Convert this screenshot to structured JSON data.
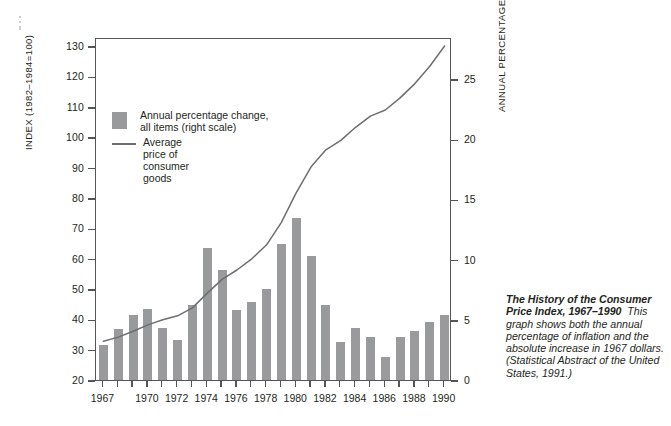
{
  "chart_data": {
    "type": "bar",
    "categories": [
      1967,
      1968,
      1969,
      1970,
      1971,
      1972,
      1973,
      1974,
      1975,
      1976,
      1977,
      1978,
      1979,
      1980,
      1981,
      1982,
      1983,
      1984,
      1985,
      1986,
      1987,
      1988,
      1989,
      1990
    ],
    "series": [
      {
        "name": "Annual percentage change, all items (right scale)",
        "type": "bar",
        "axis": "right",
        "unit": "percent",
        "values": [
          2.9,
          4.2,
          5.4,
          5.9,
          4.3,
          3.3,
          6.2,
          11.0,
          9.1,
          5.8,
          6.5,
          7.6,
          11.3,
          13.5,
          10.3,
          6.2,
          3.2,
          4.3,
          3.6,
          1.9,
          3.6,
          4.1,
          4.8,
          5.4
        ]
      },
      {
        "name": "Average price of consumer goods",
        "type": "line",
        "axis": "left",
        "unit": "index",
        "values": [
          33.4,
          34.8,
          36.7,
          38.8,
          40.5,
          41.8,
          44.4,
          49.3,
          53.8,
          56.9,
          60.6,
          65.2,
          72.6,
          82.4,
          90.9,
          96.5,
          99.6,
          103.9,
          107.6,
          109.6,
          113.6,
          118.3,
          124.0,
          130.7
        ]
      }
    ],
    "left_axis": {
      "label": "INDEX (1982-1984=100)",
      "ticks": [
        20,
        30,
        40,
        50,
        60,
        70,
        80,
        90,
        100,
        110,
        120,
        130
      ],
      "min": 20,
      "max": 133
    },
    "right_axis": {
      "label": "ANNUAL PERCENTAGE CHANGE",
      "ticks": [
        0,
        5,
        10,
        15,
        20,
        25
      ],
      "min": 0,
      "max": 28.5
    },
    "x_axis": {
      "tick_labels": [
        "1967",
        "1970",
        "1972",
        "1974",
        "1976",
        "1978",
        "1980",
        "1982",
        "1984",
        "1986",
        "1988",
        "1990"
      ],
      "min": 1967,
      "max": 1990
    },
    "grid": false,
    "legend_position": "inside-upper-left"
  },
  "legend": {
    "bar_label_line1": "Annual percentage change,",
    "bar_label_line2": "all items (right scale)",
    "line_label": "Average price of consumer goods",
    "bar_color": "#999a9b",
    "line_color": "#6d6e70"
  },
  "axes": {
    "left_title": "INDEX (1982–1984=100)",
    "right_title": "ANNUAL PERCENTAGE CHANGE",
    "left_ticks": [
      "130",
      "120",
      "110",
      "100",
      "90",
      "80",
      "70",
      "60",
      "50",
      "40",
      "30",
      "20"
    ],
    "right_ticks": [
      "25",
      "20",
      "15",
      "10",
      "5",
      "0"
    ],
    "x_ticks": [
      "1967",
      "1970",
      "1972",
      "1974",
      "1976",
      "1978",
      "1980",
      "1982",
      "1984",
      "1986",
      "1988",
      "1990"
    ]
  },
  "caption": {
    "heading": "The History of the Consumer Price Index, 1967–1990",
    "body": "This graph shows both the annual percentage of inflation and the absolute increase in 1967 dollars. (Statistical Abstract of the United States, 1991.)"
  }
}
